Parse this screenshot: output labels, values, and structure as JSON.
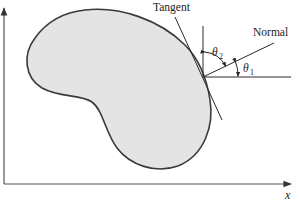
{
  "diagram": {
    "labels": {
      "tangent": "Tangent",
      "normal": "Normal",
      "theta": "θ",
      "theta1_sub": "1",
      "theta2_sub": "2",
      "x_axis": "x"
    },
    "colors": {
      "body_fill": "#e4e4e4",
      "outline": "#3a3a3a",
      "lines": "#2a2a2a",
      "axes": "#555555",
      "background": "#ffffff"
    },
    "elements": [
      "kidney-shaped-body",
      "tangent-line",
      "normal-line",
      "vertical-reference-line",
      "horizontal-reference-line",
      "theta1-angle-arc",
      "theta2-angle-arc",
      "x-axis",
      "y-axis"
    ]
  }
}
